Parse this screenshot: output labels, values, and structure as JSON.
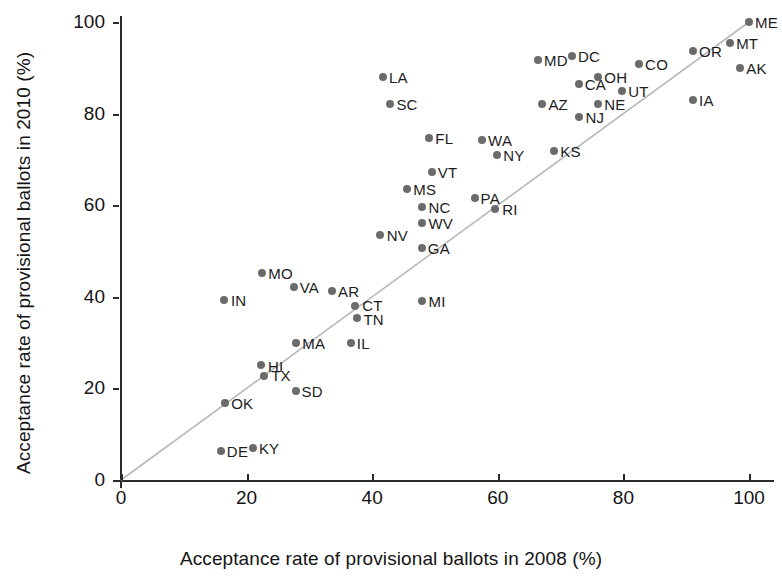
{
  "chart_data": {
    "type": "scatter",
    "title": "",
    "xlabel": "Acceptance rate of provisional ballots in 2008 (%)",
    "ylabel": "Acceptance rate of provisional ballots in 2010 (%)",
    "xlim": [
      0,
      104
    ],
    "ylim": [
      0,
      104
    ],
    "xticks": [
      0,
      20,
      40,
      60,
      80,
      100
    ],
    "yticks": [
      0,
      20,
      40,
      60,
      80,
      100
    ],
    "xticklabels": [
      "0",
      "20",
      "40",
      "60",
      "80",
      "100"
    ],
    "yticklabels": [
      "0",
      "20",
      "40",
      "60",
      "80",
      "100"
    ],
    "grid": false,
    "legend": null,
    "reference_line": {
      "type": "identity",
      "from": [
        0,
        0
      ],
      "to": [
        100,
        100
      ],
      "color": "#b9b9b9",
      "style": "solid"
    },
    "point_color": "#6b6b6b",
    "points": [
      {
        "label": "DE",
        "x": 15.9,
        "y": 6.3,
        "lx": 6,
        "ly": -8
      },
      {
        "label": "KY",
        "x": 21.0,
        "y": 7.0,
        "lx": 6,
        "ly": -8
      },
      {
        "label": "OK",
        "x": 16.6,
        "y": 16.8,
        "lx": 6,
        "ly": -8
      },
      {
        "label": "SD",
        "x": 27.8,
        "y": 19.4,
        "lx": 6,
        "ly": -8
      },
      {
        "label": "TX",
        "x": 22.8,
        "y": 22.6,
        "lx": 7,
        "ly": -9
      },
      {
        "label": "HI",
        "x": 22.3,
        "y": 25.1,
        "lx": 7,
        "ly": -7
      },
      {
        "label": "MA",
        "x": 27.9,
        "y": 29.9,
        "lx": 6,
        "ly": -8
      },
      {
        "label": "IL",
        "x": 36.6,
        "y": 30.0,
        "lx": 6,
        "ly": -8
      },
      {
        "label": "TN",
        "x": 37.5,
        "y": 35.3,
        "lx": 7,
        "ly": -7
      },
      {
        "label": "CT",
        "x": 37.3,
        "y": 38.1,
        "lx": 7,
        "ly": -9
      },
      {
        "label": "MI",
        "x": 48.0,
        "y": 39.1,
        "lx": 6,
        "ly": -8
      },
      {
        "label": "IN",
        "x": 16.4,
        "y": 39.4,
        "lx": 7,
        "ly": -8
      },
      {
        "label": "AR",
        "x": 33.6,
        "y": 41.2,
        "lx": 6,
        "ly": -8
      },
      {
        "label": "VA",
        "x": 27.5,
        "y": 42.2,
        "lx": 6,
        "ly": -8
      },
      {
        "label": "MO",
        "x": 22.5,
        "y": 45.2,
        "lx": 6,
        "ly": -8
      },
      {
        "label": "GA",
        "x": 47.9,
        "y": 50.6,
        "lx": 6,
        "ly": -8
      },
      {
        "label": "NV",
        "x": 41.2,
        "y": 53.6,
        "lx": 7,
        "ly": -8
      },
      {
        "label": "WV",
        "x": 48.0,
        "y": 56.1,
        "lx": 6,
        "ly": -8
      },
      {
        "label": "RI",
        "x": 59.6,
        "y": 59.2,
        "lx": 7,
        "ly": -8
      },
      {
        "label": "NC",
        "x": 48.0,
        "y": 59.7,
        "lx": 6,
        "ly": -8
      },
      {
        "label": "PA",
        "x": 56.3,
        "y": 61.6,
        "lx": 6,
        "ly": -8
      },
      {
        "label": "MS",
        "x": 45.6,
        "y": 63.6,
        "lx": 6,
        "ly": -8
      },
      {
        "label": "VT",
        "x": 49.5,
        "y": 67.2,
        "lx": 6,
        "ly": -8
      },
      {
        "label": "NY",
        "x": 59.9,
        "y": 70.9,
        "lx": 6,
        "ly": -8
      },
      {
        "label": "KS",
        "x": 69.0,
        "y": 71.9,
        "lx": 6,
        "ly": -8
      },
      {
        "label": "WA",
        "x": 57.5,
        "y": 74.2,
        "lx": 6,
        "ly": -8
      },
      {
        "label": "FL",
        "x": 49.1,
        "y": 74.6,
        "lx": 6,
        "ly": -8
      },
      {
        "label": "NJ",
        "x": 73.0,
        "y": 79.3,
        "lx": 6,
        "ly": -8
      },
      {
        "label": "IA",
        "x": 91.1,
        "y": 82.9,
        "lx": 6,
        "ly": -8
      },
      {
        "label": "AZ",
        "x": 67.1,
        "y": 82.1,
        "lx": 6,
        "ly": -8
      },
      {
        "label": "SC",
        "x": 42.9,
        "y": 82.0,
        "lx": 6,
        "ly": -8
      },
      {
        "label": "NE",
        "x": 76.0,
        "y": 82.2,
        "lx": 6,
        "ly": -8
      },
      {
        "label": "UT",
        "x": 79.8,
        "y": 84.9,
        "lx": 6,
        "ly": -8
      },
      {
        "label": "CA",
        "x": 72.9,
        "y": 86.5,
        "lx": 6,
        "ly": -8
      },
      {
        "label": "LA",
        "x": 41.7,
        "y": 87.9,
        "lx": 6,
        "ly": -8
      },
      {
        "label": "OH",
        "x": 76.0,
        "y": 87.9,
        "lx": 6,
        "ly": -8
      },
      {
        "label": "AK",
        "x": 98.6,
        "y": 89.9,
        "lx": 6,
        "ly": -8
      },
      {
        "label": "CO",
        "x": 82.5,
        "y": 90.8,
        "lx": 6,
        "ly": -8
      },
      {
        "label": "MD",
        "x": 66.4,
        "y": 91.7,
        "lx": 6,
        "ly": -8
      },
      {
        "label": "OR",
        "x": 91.1,
        "y": 93.6,
        "lx": 6,
        "ly": -8
      },
      {
        "label": "DC",
        "x": 71.8,
        "y": 92.6,
        "lx": 6,
        "ly": -8
      },
      {
        "label": "MT",
        "x": 97.0,
        "y": 95.4,
        "lx": 6,
        "ly": -8
      },
      {
        "label": "ME",
        "x": 100.0,
        "y": 100.0,
        "lx": 6,
        "ly": -8
      }
    ]
  }
}
